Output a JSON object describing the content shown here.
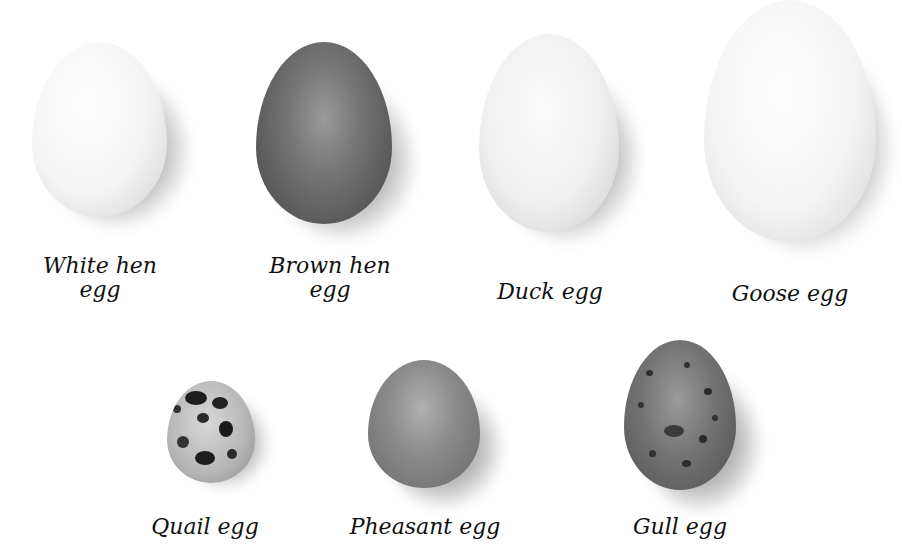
{
  "figure": {
    "eggs": [
      {
        "id": "white-hen",
        "label_line1": "White hen",
        "label_line2": "egg",
        "color": "#f4f4f4"
      },
      {
        "id": "brown-hen",
        "label_line1": "Brown hen",
        "label_line2": "egg",
        "color": "#6e6e6e"
      },
      {
        "id": "duck",
        "label_line1": "Duck egg",
        "color": "#f0f0f0"
      },
      {
        "id": "goose",
        "label_line1": "Goose egg",
        "color": "#f6f6f6"
      },
      {
        "id": "quail",
        "label_line1": "Quail egg",
        "color": "#b8b8b8"
      },
      {
        "id": "pheasant",
        "label_line1": "Pheasant egg",
        "color": "#8a8a8a"
      },
      {
        "id": "gull",
        "label_line1": "Gull egg",
        "color": "#6c6c6c"
      }
    ]
  }
}
